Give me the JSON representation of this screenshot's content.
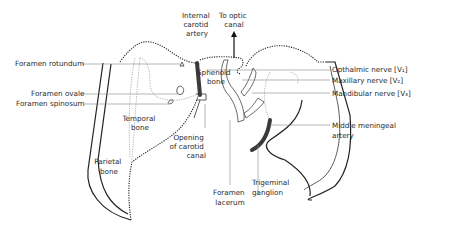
{
  "labels": {
    "foramen_rotundum": "Foramen rotundum",
    "foramen_ovale": "Foramen ovale",
    "foramen_spinosum": "Foramen spinosum",
    "internal_carotid_1": "Internal",
    "internal_carotid_2": "carotid",
    "internal_carotid_3": "artery",
    "optic_1": "To optic",
    "optic_2": "canal",
    "sphenoid_1": "Sphenoid",
    "sphenoid_2": "bone",
    "temporal_1": "Temporal",
    "temporal_2": "bone",
    "parietal_1": "Parietal",
    "parietal_2": "bone",
    "opening_1": "Opening",
    "opening_2": "of carotid",
    "opening_3": "canal",
    "lacerum_1": "Foramen",
    "lacerum_2": "lacerum",
    "trigeminal_1": "Trigeminal",
    "trigeminal_2": "ganglion",
    "opthalmic": "Opthalmic nerve [V₁]",
    "maxillary": "Maxillary nerve [V₂]",
    "mandibular": "Mandibular nerve [V₃]",
    "meningeal_1": "Middle meningeal",
    "meningeal_2": "artery"
  }
}
